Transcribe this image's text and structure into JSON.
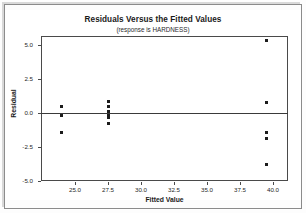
{
  "chart_data": {
    "type": "scatter",
    "title": "Residuals Versus the Fitted Values",
    "subtitle": "(response is HARDNESS)",
    "xlabel": "Fitted Value",
    "ylabel": "Residual",
    "xlim": [
      23.0,
      41.0
    ],
    "ylim": [
      -5.0,
      5.5
    ],
    "xticks": [
      "25.0",
      "27.5",
      "30.0",
      "32.5",
      "35.0",
      "37.5",
      "40.0"
    ],
    "xtick_values": [
      25.0,
      27.5,
      30.0,
      32.5,
      35.0,
      37.5,
      40.0
    ],
    "yticks": [
      "5.0",
      "2.5",
      "0.0",
      "-2.5",
      "-5.0"
    ],
    "ytick_values": [
      5.0,
      2.5,
      0.0,
      -2.5,
      -5.0
    ],
    "grid": false,
    "legend": null,
    "reference_line": {
      "orientation": "horizontal",
      "y": 0.0
    },
    "points": [
      {
        "x": 24.0,
        "y": 0.5
      },
      {
        "x": 24.0,
        "y": -0.2
      },
      {
        "x": 24.0,
        "y": -1.4
      },
      {
        "x": 27.5,
        "y": 0.85
      },
      {
        "x": 27.5,
        "y": 0.45
      },
      {
        "x": 27.5,
        "y": 0.1
      },
      {
        "x": 27.5,
        "y": -0.1
      },
      {
        "x": 27.5,
        "y": -0.35
      },
      {
        "x": 27.5,
        "y": -0.8
      },
      {
        "x": 39.5,
        "y": 5.3
      },
      {
        "x": 39.5,
        "y": 0.8
      },
      {
        "x": 39.5,
        "y": -1.4
      },
      {
        "x": 39.5,
        "y": -1.9
      },
      {
        "x": 39.5,
        "y": -3.8
      }
    ]
  }
}
